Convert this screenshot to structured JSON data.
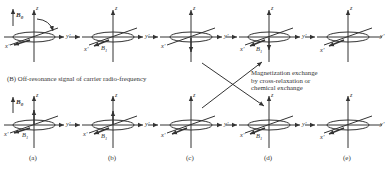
{
  "figure": {
    "section_b_title": "(B) Off-resonance signal of carrier radio-frequency",
    "exchange_annotation": {
      "line1": "Magnetization exchange",
      "line2": "by cross-relaxation or",
      "line3": "chemical exchange"
    },
    "panel_labels": [
      "(a)",
      "(b)",
      "(c)",
      "(d)",
      "(e)"
    ],
    "axis_labels": {
      "z": "z",
      "y": "y'",
      "x": "x'"
    },
    "field_labels": {
      "B0": "B",
      "B0_sub": "0",
      "B1": "B",
      "B1_sub": "1"
    },
    "rows": [
      {
        "name": "top-row",
        "panels": [
          "a",
          "b",
          "c",
          "d",
          "e"
        ]
      },
      {
        "name": "bottom-row",
        "panels": [
          "a",
          "b",
          "c",
          "d",
          "e"
        ]
      }
    ]
  }
}
